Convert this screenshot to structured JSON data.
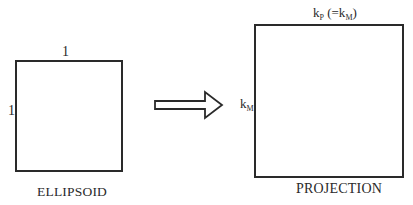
{
  "diagram": {
    "ellipsoid": {
      "top_label": "1",
      "side_label": "1",
      "caption": "ELLIPSOID"
    },
    "arrow": {
      "icon": "right-arrow-outline-icon",
      "direction": "right"
    },
    "projection": {
      "top_label_main": "k",
      "top_label_sub": "P",
      "top_label_paren_open": " (=k",
      "top_label_paren_sub": "M",
      "top_label_paren_close": ")",
      "side_label_main": "k",
      "side_label_sub": "M",
      "caption": "PROJECTION"
    },
    "colors": {
      "stroke": "#2a2a2a",
      "background": "#ffffff"
    }
  }
}
